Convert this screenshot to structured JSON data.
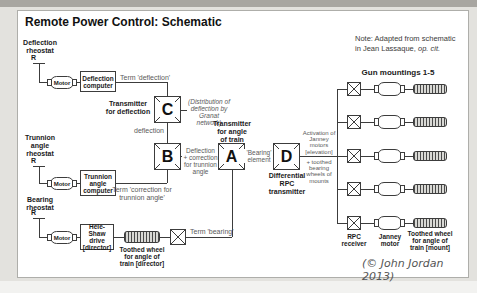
{
  "title": "Remote Power Control: Schematic",
  "note": {
    "line1": "Note: Adapted from schematic",
    "line2": "in Jean Lassaque, ",
    "line2_cite": "op. cit."
  },
  "copyright": "(© John Jordan 2013)",
  "deflection": {
    "rheostat": "Deflection\nrheostat",
    "symbol": "R",
    "motor": "Motor",
    "computer": "Deflection\ncomputer",
    "term": "Term 'deflection'",
    "wire": "deflection"
  },
  "trunnion": {
    "rheostat": "Trunnion\nangle\nrheostat",
    "symbol": "R",
    "motor": "Motor",
    "computer": "Trunnion\nangle\ncomputer",
    "term": "Term 'correction for\ntrunnion angle'"
  },
  "bearing": {
    "rheostat": "Bearing\nrheostat",
    "symbol": "R",
    "motor": "Motor",
    "drive": "Hele-Shaw\ndrive\n[director]",
    "wheel": "Toothed wheel\nfor angle of\ntrain [director]",
    "term": "Term 'bearing'"
  },
  "transmitters": {
    "c": {
      "letter": "C",
      "label": "Transmitter\nfor deflection",
      "note": "(Distribution of\ndeflection by\nGranat network)"
    },
    "b": {
      "letter": "B",
      "output": "Deflection\n+ correction\nfor trunnion\nangle"
    },
    "a": {
      "letter": "A",
      "label": "Transmitter\nfor angle\nof train",
      "input": "'Bearing'\nelement"
    },
    "d": {
      "letter": "D",
      "label": "Differential\nRPC\ntransmitter",
      "output": "Activation of\nJanney\nmotors\n[elevation]",
      "output2": "+ toothed\nbearing\nwheels of\nmounts"
    }
  },
  "gun_mountings": {
    "header": "Gun mountings 1-5",
    "receiver": "RPC\nreceiver",
    "motor": "Janney\nmotor",
    "wheel": "Toothed wheel\nfor angle of\ntrain [mount]"
  }
}
